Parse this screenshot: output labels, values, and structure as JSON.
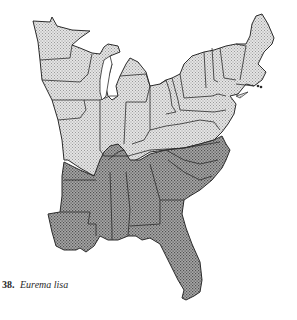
{
  "figure": {
    "number": "38.",
    "species": "Eurema lisa"
  },
  "legend": {
    "light_fill": "#d6d6d6",
    "dark_fill": "#8e8e8e",
    "outline": "#2b2b2b"
  }
}
